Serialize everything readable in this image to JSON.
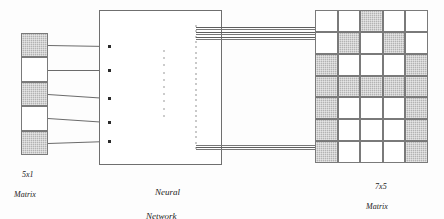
{
  "diagram": {
    "title_semantic": "neural-network-character-recognition-diagram",
    "input": {
      "caption_line1": "5x1",
      "caption_line2": "Matrix",
      "rows": 5,
      "cols": 1,
      "cells": [
        [
          1
        ],
        [
          0
        ],
        [
          1
        ],
        [
          0
        ],
        [
          1
        ]
      ],
      "on_color": "#b3b3b3",
      "off_color": "#ffffff",
      "border_color": "#7a7a7a"
    },
    "network": {
      "caption_line1": "Neural",
      "caption_line2": "Network",
      "input_node_count": 5,
      "hidden_dot_count": 10,
      "output_dot_count": 24,
      "box_border_color": "#6f6f6f",
      "node_color": "#2b2b2b",
      "wire_color": "#6b6b6b"
    },
    "output": {
      "caption_line1": "7x5",
      "caption_line2": "Matrix",
      "rows": 7,
      "cols": 5,
      "cells": [
        [
          0,
          0,
          1,
          0,
          0
        ],
        [
          0,
          1,
          0,
          1,
          0
        ],
        [
          1,
          0,
          0,
          0,
          1
        ],
        [
          1,
          1,
          1,
          1,
          1
        ],
        [
          1,
          0,
          0,
          0,
          1
        ],
        [
          1,
          0,
          0,
          0,
          1
        ],
        [
          1,
          0,
          0,
          0,
          1
        ]
      ],
      "on_color": "#b3b3b3",
      "off_color": "#ffffff",
      "border_color": "#7a7a7a"
    },
    "bundles": {
      "top_line_count": 6,
      "bottom_line_count": 3,
      "line_color": "#777777"
    }
  }
}
